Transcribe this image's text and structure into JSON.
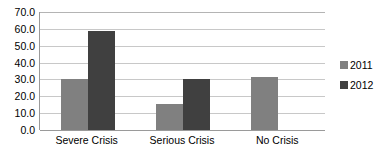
{
  "chart_data": {
    "type": "bar",
    "title": "",
    "subtitle": "",
    "xlabel": "",
    "ylabel": "",
    "categories": [
      "Severe Crisis",
      "Serious Crisis",
      "No Crisis"
    ],
    "series": [
      {
        "name": "2011",
        "color": "#808080",
        "values": [
          30.0,
          15.5,
          31.5
        ]
      },
      {
        "name": "2012",
        "color": "#404040",
        "values": [
          59.0,
          30.5,
          null
        ]
      }
    ],
    "ylim": [
      0.0,
      70.0
    ],
    "ytick_step": 10.0,
    "ytick_labels": [
      "70.0",
      "60.0",
      "50.0",
      "40.0",
      "30.0",
      "20.0",
      "10.0",
      "0.0"
    ],
    "ytick_values": [
      70.0,
      60.0,
      50.0,
      40.0,
      30.0,
      20.0,
      10.0,
      0.0
    ],
    "grid": true,
    "grid_axis": "y",
    "legend_position": "right",
    "legend_entries": [
      "2011",
      "2012"
    ],
    "annotations": [],
    "colors": {
      "background": "#ffffff",
      "gridline": "#c8c8c8",
      "axis": "#9a9a9a",
      "text": "#000000",
      "series_2011": "#808080",
      "series_2012": "#404040"
    }
  }
}
